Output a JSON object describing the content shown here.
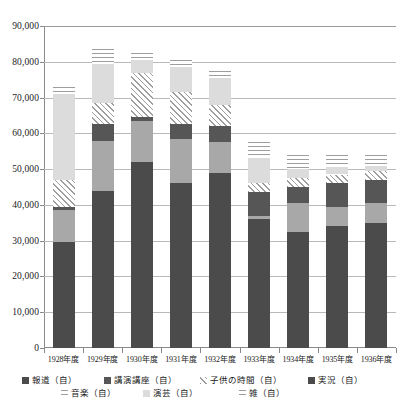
{
  "chart_data": {
    "type": "bar",
    "subtype": "stacked-vertical",
    "title": "",
    "xlabel": "",
    "ylabel": "",
    "ylim": [
      0,
      90000
    ],
    "ytick_step": 10000,
    "grid": true,
    "legend_position": "bottom",
    "categories": [
      "1928年度",
      "1929年度",
      "1930年度",
      "1931年度",
      "1932年度",
      "1933年度",
      "1934年度",
      "1935年度",
      "1936年度"
    ],
    "ytick_labels": [
      "90,000",
      "80,000",
      "70,000",
      "60,000",
      "50,000",
      "40,000",
      "30,000",
      "20,000",
      "10,000",
      "0"
    ],
    "ytick_values": [
      90000,
      80000,
      70000,
      60000,
      50000,
      40000,
      30000,
      20000,
      10000,
      0
    ],
    "series": [
      {
        "name": "報道（自）",
        "pattern": "solid-dark-gray",
        "color": "#4b4b4b",
        "values": [
          29500,
          44000,
          52000,
          46000,
          49000,
          36000,
          32500,
          34000,
          35000
        ]
      },
      {
        "name": "音楽（自）",
        "pattern": "solid-medium-gray",
        "color": "#a8a8a8",
        "values": [
          9000,
          14000,
          11500,
          12500,
          8500,
          1000,
          8000,
          5500,
          5500
        ]
      },
      {
        "name": "講演講座（自）",
        "pattern": "solid-dark-gray",
        "color": "#565656",
        "values": [
          1000,
          4500,
          1000,
          4000,
          4500,
          6500,
          4500,
          6500,
          6500
        ]
      },
      {
        "name": "演芸（自）",
        "pattern": "diagonal-hatch",
        "color": "#9e9e9e",
        "values": [
          7500,
          6000,
          12500,
          9000,
          6000,
          2500,
          2500,
          2500,
          2500
        ]
      },
      {
        "name": "子供の時間（自）",
        "pattern": "solid-light-gray",
        "color": "#dcdcdc",
        "values": [
          24000,
          11000,
          3500,
          7000,
          7500,
          7000,
          2500,
          2000,
          1500
        ]
      },
      {
        "name": "雑（自）",
        "pattern": "horizontal-lines",
        "color": "#9e9e9e",
        "values": [
          2000,
          4000,
          2000,
          2000,
          2000,
          4500,
          4000,
          3500,
          3000
        ]
      }
    ],
    "totals": [
      73000,
      83500,
      82500,
      80500,
      77500,
      57500,
      54000,
      54000,
      54000
    ]
  },
  "legend": {
    "row1": [
      {
        "label": "報道（自）",
        "swatch": "p-houdou"
      },
      {
        "label": "講演講座（自）",
        "swatch": "p-kouen"
      },
      {
        "label": "子供の時間（自）",
        "swatch": "p-engei"
      },
      {
        "label": "実況（自）",
        "swatch": "p-houdou"
      }
    ],
    "row2": [
      {
        "label": "音楽（自）",
        "swatch": "p-zatsu"
      },
      {
        "label": "演芸（自）",
        "swatch": "p-kodomo"
      },
      {
        "label": "雑（自）",
        "swatch": "p-zatsu"
      }
    ]
  }
}
